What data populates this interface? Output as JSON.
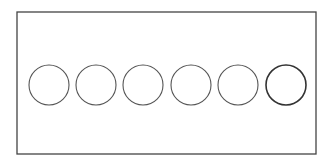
{
  "diagram": {
    "canvas": {
      "width": 332,
      "height": 167,
      "background": "#ffffff"
    },
    "frame": {
      "x": 17,
      "y": 12,
      "width": 299,
      "height": 142,
      "stroke": "#444444",
      "stroke_width": 1.3
    },
    "circles": [
      {
        "cx": 49,
        "cy": 85,
        "r": 20,
        "stroke": "#555555",
        "stroke_width": 1.1
      },
      {
        "cx": 96,
        "cy": 85,
        "r": 20,
        "stroke": "#555555",
        "stroke_width": 1.1
      },
      {
        "cx": 143,
        "cy": 85,
        "r": 20,
        "stroke": "#555555",
        "stroke_width": 1.1
      },
      {
        "cx": 191,
        "cy": 85,
        "r": 20,
        "stroke": "#555555",
        "stroke_width": 1.1
      },
      {
        "cx": 238,
        "cy": 85,
        "r": 20,
        "stroke": "#555555",
        "stroke_width": 1.1
      },
      {
        "cx": 286,
        "cy": 85,
        "r": 20,
        "stroke": "#333333",
        "stroke_width": 1.6
      }
    ]
  }
}
